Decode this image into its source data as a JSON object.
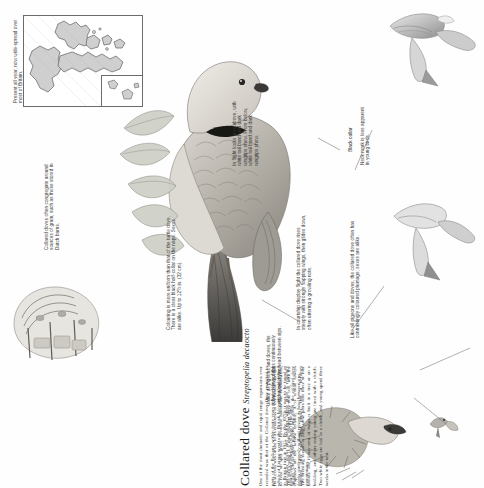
{
  "page": {
    "kind": "field-guide-page",
    "orientation_note": "page scanned rotated 90 degrees counter-clockwise",
    "background_color": "#fefefe",
    "ink_color": "#2a2a2a"
  },
  "map": {
    "caption": "Present all year; now wide-spread over most of Britain.",
    "land_fill": "#cfcfcf",
    "land_stroke": "#6b6b6b",
    "border_color": "#6b6b6b",
    "has_inset": true
  },
  "title": {
    "common_name": "Collared dove",
    "scientific_name": "Streptopelia decaocto"
  },
  "article": {
    "columns": [
      "One of the most dramatic and rapid range expansions ever recorded was that of the Collared dove. Once restricted to parts of the Balkans, within forty years it had colonised the whole of Europe west to the British Isles and Iceland. It bred in Britain first in 1955. By the 1970s it was to be found in nearly every town and village in the land.",
      "Its success was linked to its readiness to live beside man and to feed on spilt grain. Favourite haunts are chicken runs, corn mills, docks and maltings, where grain is regularly spilled. Unlike other pigeons and doves, the collared dove drinks continuously without raising its head between sips.",
      "The bird's song is a soft, insistent three-note coo, with the emphasis on the second syllable; it is almost always repeated, after only short pauses, that it becomes monotonous.",
      "The breeding season is long; some pairs rear three or four broods. The flimsy nest of twigs is built in a tree or on a building, and others rearing young are lined with a clutch. Two white eggs are laid in a clutch, and young spend three weeks in the nest."
    ]
  },
  "annotations": [
    {
      "id": "in-flight",
      "text": "In flight looks grey above, with white tail band and dark wingtips show. From below, white tail band and dark wingtips show."
    },
    {
      "id": "black-collar",
      "text": "Black collar"
    },
    {
      "id": "neck-mark",
      "text": "Neck mark is less apparent in young birds."
    },
    {
      "id": "display-flight",
      "text": "In courtship display flight the collared dove rises steeply with strongly flapping wings, then glides down, often uttering a growling note."
    },
    {
      "id": "sexes-alike",
      "text": "Like all pigeons and doves, the collared dove often has contrastingly coloured plumage; sexes are alike."
    },
    {
      "id": "colouring",
      "text": "Colouring is more uniform than that of the turtle dove. There is a clear black half-collar on the nape. Sexes are alike. Up to 12½ in. (32 cm)."
    },
    {
      "id": "dutch-barns",
      "text": "Collared doves often congregate around sources of grain, such as those stored in Dutch barns."
    },
    {
      "id": "drinking",
      "text": "Unlike all pigeons and doves, the collared dove drinks continuously without raising its head between sips."
    }
  ],
  "illustrations": [
    {
      "id": "flight-upper",
      "label": "flying-dove-from-above"
    },
    {
      "id": "flight-lower",
      "label": "flying-dove-from-below"
    },
    {
      "id": "perched-main",
      "label": "perched-collared-dove-main"
    },
    {
      "id": "nest-scene",
      "label": "dove-on-nest"
    },
    {
      "id": "barn-scene",
      "label": "dutch-barn-with-doves"
    },
    {
      "id": "distant-dove",
      "label": "small-flying-dove"
    }
  ]
}
